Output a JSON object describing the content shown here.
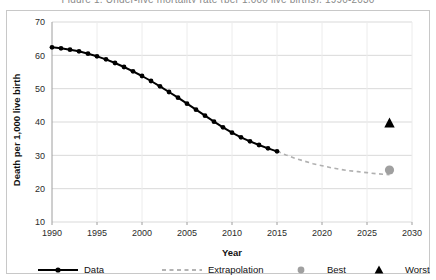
{
  "figure": {
    "cut_off_header": "Figure 1. Under-five mortality rate (per 1,000 live births), 1990-2030",
    "frame_color": "#c8c8c8",
    "background": "#ffffff"
  },
  "chart_data": {
    "type": "line",
    "title": "",
    "xlabel": "Year",
    "ylabel": "Death per 1,000 live birth",
    "xlim": [
      1990,
      2030
    ],
    "ylim": [
      10,
      70
    ],
    "xticks": [
      1990,
      1995,
      2000,
      2005,
      2010,
      2015,
      2020,
      2025,
      2030
    ],
    "yticks": [
      10,
      20,
      30,
      40,
      50,
      60,
      70
    ],
    "grid": true,
    "legend_position": "bottom",
    "series": [
      {
        "name": "Data",
        "style": "solid-line-with-markers",
        "color": "#000000",
        "x": [
          1990,
          1991,
          1992,
          1993,
          1994,
          1995,
          1996,
          1997,
          1998,
          1999,
          2000,
          2001,
          2002,
          2003,
          2004,
          2005,
          2006,
          2007,
          2008,
          2009,
          2010,
          2011,
          2012,
          2013,
          2014,
          2015
        ],
        "values": [
          62.4,
          62.1,
          61.7,
          61.2,
          60.5,
          59.7,
          58.8,
          57.7,
          56.5,
          55.2,
          53.8,
          52.3,
          50.7,
          49.0,
          47.3,
          45.5,
          43.7,
          41.9,
          40.1,
          38.4,
          36.8,
          35.4,
          34.2,
          33.1,
          32.1,
          31.2
        ]
      },
      {
        "name": "Extrapolation",
        "style": "dashed-line",
        "color": "#b0b0b0",
        "x": [
          2015,
          2016,
          2017,
          2018,
          2019,
          2020,
          2021,
          2022,
          2023,
          2024,
          2025,
          2026,
          2027,
          2027.5
        ],
        "values": [
          31.2,
          30.1,
          29.1,
          28.3,
          27.5,
          26.9,
          26.3,
          25.8,
          25.4,
          25.1,
          24.8,
          24.5,
          24.3,
          24.2
        ]
      }
    ],
    "points": [
      {
        "name": "Best",
        "marker": "circle",
        "color": "#a0a0a0",
        "x": 2027.5,
        "y": 25.6
      },
      {
        "name": "Worst",
        "marker": "triangle",
        "color": "#000000",
        "x": 2027.5,
        "y": 39.7
      }
    ],
    "legend": [
      {
        "label": "Data",
        "marker": "solid-line-marker",
        "color": "#000000"
      },
      {
        "label": "Extrapolation",
        "marker": "dashed-line",
        "color": "#9a9a9a"
      },
      {
        "label": "Best",
        "marker": "circle",
        "color": "#a0a0a0"
      },
      {
        "label": "Worst",
        "marker": "triangle",
        "color": "#000000"
      }
    ]
  }
}
